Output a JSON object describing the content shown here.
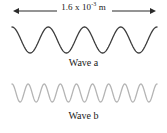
{
  "figure": {
    "background_color": "#ffffff",
    "dimension": {
      "value": "1.6 x 10",
      "exponent": "-3",
      "unit": " m",
      "full_text": "1.6 x 10-3 m",
      "arrow_style": "double-headed",
      "arrow_color": "#2b2b2b",
      "arrow_x_start": 12,
      "arrow_x_end": 157,
      "arrow_y": 11
    },
    "waves": [
      {
        "id": "wave-a",
        "caption": "Wave a",
        "color": "#3c3c3c",
        "cycles": 4,
        "amplitude_px": 13,
        "stroke_width": 1.3,
        "center_y": 40,
        "x_start": 12,
        "x_end": 157,
        "start_phase": "crest"
      },
      {
        "id": "wave-b",
        "caption": "Wave b",
        "color": "#b4b4b4",
        "cycles": 9,
        "amplitude_px": 9,
        "stroke_width": 1.3,
        "center_y": 93,
        "x_start": 12,
        "x_end": 157,
        "start_phase": "crest"
      }
    ]
  },
  "chart_data": {
    "type": "line",
    "title": "",
    "xlabel": "",
    "ylabel": "",
    "annotations": [
      "1.6 x 10-3 m"
    ],
    "series": [
      {
        "name": "Wave a",
        "waveform": "cosine",
        "cycles_over_span": 4,
        "wavelength_m": 0.0004,
        "amplitude_relative": 1.0,
        "color": "#3c3c3c"
      },
      {
        "name": "Wave b",
        "waveform": "cosine",
        "cycles_over_span": 9,
        "wavelength_m": 0.000178,
        "amplitude_relative": 0.69,
        "color": "#b4b4b4"
      }
    ],
    "span_label": "1.6 x 10-3 m",
    "span_value": 0.0016,
    "span_unit": "m"
  }
}
